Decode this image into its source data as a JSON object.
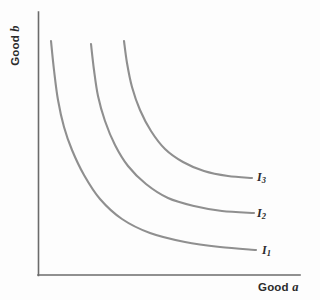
{
  "figure": {
    "background_color": "#fdfdfd",
    "axis_color": "#6b6b6b",
    "curve_color": "#8f8f8f",
    "text_color": "#2b2b2b"
  },
  "axes": {
    "y_label_prefix": "Good ",
    "y_label_variable": "b",
    "x_label_prefix": "Good ",
    "x_label_variable": "a"
  },
  "curve_labels": [
    {
      "base": "I",
      "sub": "1"
    },
    {
      "base": "I",
      "sub": "2"
    },
    {
      "base": "I",
      "sub": "3"
    }
  ],
  "chart_data": {
    "type": "line",
    "title": "",
    "subtitle": "",
    "xlabel": "Good a",
    "ylabel": "Good b",
    "grid": false,
    "legend": false,
    "annotations": [
      "I1",
      "I2",
      "I3"
    ],
    "axis_origin_px": [
      38,
      275
    ],
    "x_axis_end_px": [
      300,
      275
    ],
    "y_axis_end_px": [
      38,
      12
    ],
    "series": [
      {
        "name": "I1",
        "label": "I₁",
        "utility_rank": 1,
        "points_px": [
          [
            51,
            41
          ],
          [
            54,
            70
          ],
          [
            58,
            100
          ],
          [
            64,
            127
          ],
          [
            72,
            150
          ],
          [
            84,
            175
          ],
          [
            100,
            199
          ],
          [
            122,
            219
          ],
          [
            150,
            233
          ],
          [
            185,
            242
          ],
          [
            220,
            247
          ],
          [
            256,
            250
          ]
        ]
      },
      {
        "name": "I2",
        "label": "I₂",
        "utility_rank": 2,
        "points_px": [
          [
            91,
            44
          ],
          [
            94,
            70
          ],
          [
            98,
            96
          ],
          [
            105,
            121
          ],
          [
            115,
            145
          ],
          [
            128,
            166
          ],
          [
            146,
            184
          ],
          [
            168,
            198
          ],
          [
            194,
            206
          ],
          [
            222,
            211
          ],
          [
            254,
            213
          ]
        ]
      },
      {
        "name": "I3",
        "label": "I₃",
        "utility_rank": 3,
        "points_px": [
          [
            124,
            41
          ],
          [
            127,
            63
          ],
          [
            132,
            87
          ],
          [
            140,
            110
          ],
          [
            151,
            131
          ],
          [
            165,
            149
          ],
          [
            183,
            162
          ],
          [
            204,
            171
          ],
          [
            228,
            176
          ],
          [
            252,
            178
          ]
        ]
      }
    ]
  }
}
